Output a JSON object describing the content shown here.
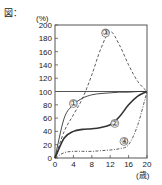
{
  "figure_label": "図：",
  "chart_data": {
    "type": "line",
    "title": "",
    "xlabel": "(歳)",
    "ylabel": "(%)",
    "xlim": [
      0,
      20
    ],
    "ylim": [
      0,
      200
    ],
    "x_ticks": [
      "0",
      "4",
      "8",
      "12",
      "16",
      "20"
    ],
    "y_ticks": [
      "0",
      "20",
      "40",
      "60",
      "80",
      "100",
      "120",
      "140",
      "160",
      "180",
      "200"
    ],
    "grid": false,
    "reference_line": {
      "y": 100
    },
    "x": [
      0,
      2,
      4,
      6,
      8,
      10,
      12,
      14,
      16,
      18,
      20
    ],
    "series": [
      {
        "name": "①",
        "style": "solid-thin",
        "values": [
          0,
          60,
          80,
          90,
          95,
          97,
          98,
          99,
          99,
          100,
          100
        ]
      },
      {
        "name": "②",
        "style": "solid-thick",
        "values": [
          0,
          30,
          40,
          43,
          44,
          46,
          50,
          62,
          80,
          93,
          100
        ]
      },
      {
        "name": "③",
        "style": "dashed",
        "values": [
          0,
          40,
          65,
          90,
          125,
          165,
          190,
          170,
          140,
          115,
          100
        ]
      },
      {
        "name": "④",
        "style": "dash-dot",
        "values": [
          0,
          8,
          10,
          10,
          10,
          11,
          12,
          14,
          20,
          50,
          100
        ]
      }
    ]
  }
}
